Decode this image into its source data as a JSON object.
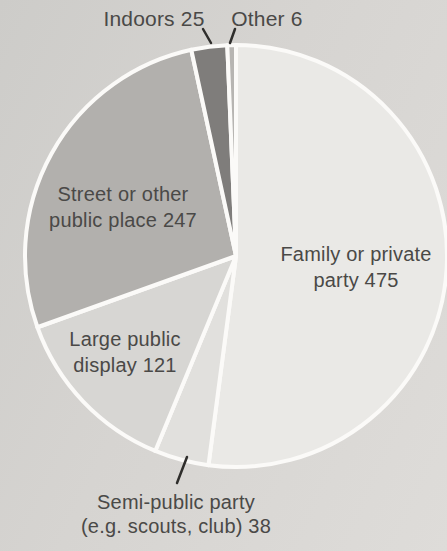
{
  "chart_data": {
    "type": "pie",
    "title": "",
    "total": 912,
    "direction": "clockwise",
    "start_angle_deg": 0,
    "legend_position": "labels-on-and-around-slices",
    "background_color": "#d5d3d0",
    "separator_color": "#fbfaf8",
    "text_color": "#4a4947",
    "leader_line_color": "#2f2e2c",
    "slices": [
      {
        "id": "family-private-party",
        "label": "Family or private party 475",
        "label_lines": [
          "Family or private",
          "party 475"
        ],
        "value": 475,
        "color": "#eae9e6",
        "label_placement": "inside"
      },
      {
        "id": "semi-public-party",
        "label": "Semi-public party (e.g. scouts, club) 38",
        "label_lines": [
          "Semi-public party",
          "(e.g. scouts, club) 38"
        ],
        "value": 38,
        "color": "#e1e0dd",
        "label_placement": "outside-bottom"
      },
      {
        "id": "large-public-display",
        "label": "Large public display 121",
        "label_lines": [
          "Large public",
          "display 121"
        ],
        "value": 121,
        "color": "#d7d6d3",
        "label_placement": "inside"
      },
      {
        "id": "street-public-place",
        "label": "Street or other public place 247",
        "label_lines": [
          "Street or other",
          "public place 247"
        ],
        "value": 247,
        "color": "#b2b0ad",
        "label_placement": "inside"
      },
      {
        "id": "indoors",
        "label": "Indoors 25",
        "label_lines": [
          "Indoors 25"
        ],
        "value": 25,
        "color": "#7f7d7b",
        "label_placement": "outside-top"
      },
      {
        "id": "other",
        "label": "Other 6",
        "label_lines": [
          "Other 6"
        ],
        "value": 6,
        "color": "#b7b5b2",
        "label_placement": "outside-top"
      }
    ]
  }
}
